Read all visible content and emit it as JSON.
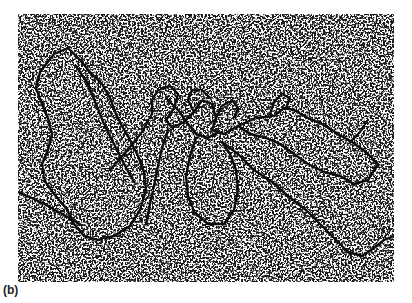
{
  "figure": {
    "panel_label": "(b)",
    "image_kind": "electron-micrograph",
    "colors": {
      "background": "#ffffff",
      "stipple": "#1a1a1a",
      "strand": "#0d0d0d"
    }
  }
}
